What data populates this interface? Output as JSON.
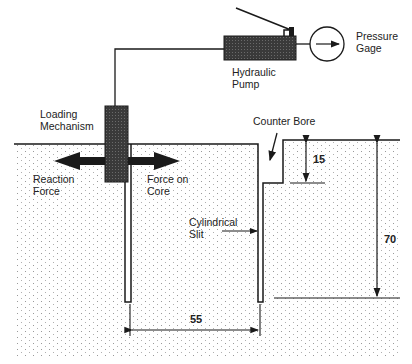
{
  "diagram": {
    "type": "flac-jack core test schematic",
    "labels": {
      "pressure_gage": "Pressure\nGage",
      "hydraulic_pump": "Hydraulic\nPump",
      "loading_mechanism": "Loading\nMechanism",
      "counter_bore": "Counter Bore",
      "reaction_force": "Reaction\nForce",
      "force_on_core": "Force on\nCore",
      "cylindrical_slit": "Cylindrical\nSlit"
    },
    "dimensions": {
      "counter_bore_depth": "15",
      "slit_depth": "70",
      "core_diameter": "55"
    },
    "colors": {
      "ink": "#1a1a1a",
      "fill_dark": "#3a3a3a",
      "background": "#ffffff",
      "dots": "#9a9a9a"
    }
  }
}
